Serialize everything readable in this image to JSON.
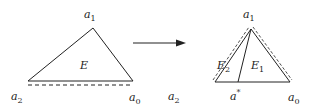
{
  "diagram": {
    "left_triangle": {
      "vertices": {
        "a1": "a",
        "a1_sub": "1",
        "a2": "a",
        "a2_sub": "2",
        "a0": "a",
        "a0_sub": "0"
      },
      "region": "E"
    },
    "arrow": "right-arrow",
    "right_triangle": {
      "vertices": {
        "a1": "a",
        "a1_sub": "1",
        "a2": "a",
        "a2_sub": "2",
        "a0": "a",
        "a0_sub": "0",
        "astar": "a",
        "astar_sup": "*"
      },
      "regions": {
        "E2": "E",
        "E2_sub": "2",
        "E1": "E",
        "E1_sub": "1"
      }
    },
    "colors": {
      "stroke": "#222222"
    }
  }
}
